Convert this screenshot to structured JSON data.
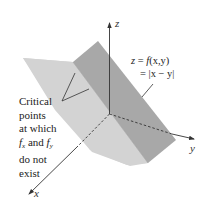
{
  "diagram": {
    "axes": {
      "x": {
        "label": "x"
      },
      "y": {
        "label": "y"
      },
      "z": {
        "label": "z"
      }
    },
    "equation": {
      "line1_lhs": "z = ",
      "line1_func": "f",
      "line1_args": "(x,y)",
      "line2": "= |x − y|"
    },
    "annotation": {
      "line1": "Critical",
      "line2": "points",
      "line3": "at which",
      "line4_f1": "f",
      "line4_sub1": "x",
      "line4_mid": " and ",
      "line4_f2": "f",
      "line4_sub2": "y",
      "line5": "do not",
      "line6": "exist"
    },
    "colors": {
      "light_plane": "#d2d2d2",
      "dark_plane": "#a9a9a9",
      "axis": "#333333",
      "background": "#ffffff"
    }
  }
}
